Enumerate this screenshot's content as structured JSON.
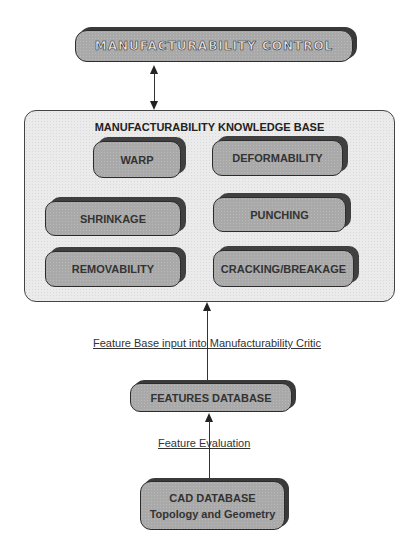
{
  "diagram": {
    "control": {
      "label": "MANUFACTURABILITY CONTROL"
    },
    "knowledge_base": {
      "title": "MANUFACTURABILITY KNOWLEDGE BASE",
      "modules": [
        {
          "label": "WARP"
        },
        {
          "label": "DEFORMABILITY"
        },
        {
          "label": "SHRINKAGE"
        },
        {
          "label": "PUNCHING"
        },
        {
          "label": "REMOVABILITY"
        },
        {
          "label": "CRACKING/BREAKAGE"
        }
      ]
    },
    "edges": {
      "kb_to_features": "Feature Base input into Manufacturability Critic",
      "features_to_cad": "Feature Evaluation"
    },
    "features_db": {
      "label": "FEATURES DATABASE"
    },
    "cad_db": {
      "line1": "CAD DATABASE",
      "line2": "Topology and Geometry"
    },
    "colors": {
      "box_fill": "#a9a9a9",
      "box_border": "#2c2c2c",
      "panel_fill": "#ebebeb",
      "text": "#333333"
    }
  }
}
